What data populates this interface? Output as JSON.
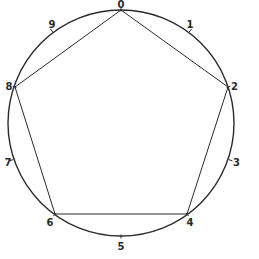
{
  "diagram": {
    "type": "circle-with-inscribed-pentagon",
    "circle": {
      "cx": 121,
      "cy": 123,
      "r": 113,
      "stroke": "#2a2a2a"
    },
    "points": [
      {
        "label": "0",
        "x": 121,
        "y": 10,
        "lx": 121,
        "ly": 8,
        "anchor": "middle"
      },
      {
        "label": "1",
        "x": 190,
        "y": 31,
        "lx": 190,
        "ly": 28,
        "anchor": "middle"
      },
      {
        "label": "2",
        "x": 228,
        "y": 87,
        "lx": 231,
        "ly": 90,
        "anchor": "start"
      },
      {
        "label": "3",
        "x": 230,
        "y": 160,
        "lx": 233,
        "ly": 166,
        "anchor": "start"
      },
      {
        "label": "4",
        "x": 187,
        "y": 214,
        "lx": 190,
        "ly": 226,
        "anchor": "middle"
      },
      {
        "label": "5",
        "x": 121,
        "y": 236,
        "lx": 121,
        "ly": 250,
        "anchor": "middle"
      },
      {
        "label": "6",
        "x": 55,
        "y": 214,
        "lx": 50,
        "ly": 226,
        "anchor": "middle"
      },
      {
        "label": "7",
        "x": 12,
        "y": 160,
        "lx": 8,
        "ly": 166,
        "anchor": "middle"
      },
      {
        "label": "8",
        "x": 15,
        "y": 87,
        "lx": 9,
        "ly": 90,
        "anchor": "middle"
      },
      {
        "label": "9",
        "x": 52,
        "y": 31,
        "lx": 52,
        "ly": 28,
        "anchor": "middle"
      }
    ],
    "pentagon_vertices": [
      "0",
      "2",
      "4",
      "6",
      "8"
    ],
    "line_color": "#2a2a2a"
  }
}
